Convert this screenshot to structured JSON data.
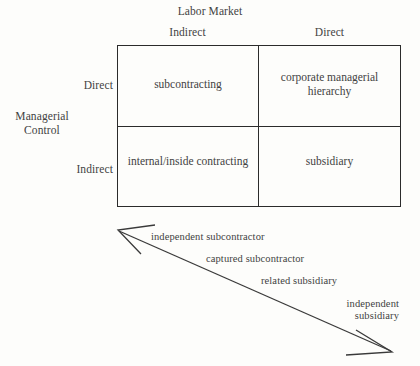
{
  "figure": {
    "column_axis_title": "Labor Market",
    "row_axis_title": "Managerial\nControl",
    "columns": [
      {
        "label": "Indirect"
      },
      {
        "label": "Direct"
      }
    ],
    "rows": [
      {
        "label": "Direct"
      },
      {
        "label": "Indirect"
      }
    ],
    "cells": [
      {
        "label": "subcontracting"
      },
      {
        "label": "corporate managerial\nhierarchy"
      },
      {
        "label": "internal/inside\ncontracting"
      },
      {
        "label": "subsidiary"
      }
    ],
    "spectrum": {
      "arrow_style": "double-headed",
      "direction": "upper-left to lower-right",
      "labels": [
        {
          "label": "independent subcontractor"
        },
        {
          "label": "captured subcontractor"
        },
        {
          "label": "related subsidiary"
        },
        {
          "label": "independent\nsubsidiary"
        }
      ]
    },
    "colors": {
      "ink": "#424242",
      "rule": "#2b2b2b",
      "paper": "#fdfdfb"
    }
  }
}
